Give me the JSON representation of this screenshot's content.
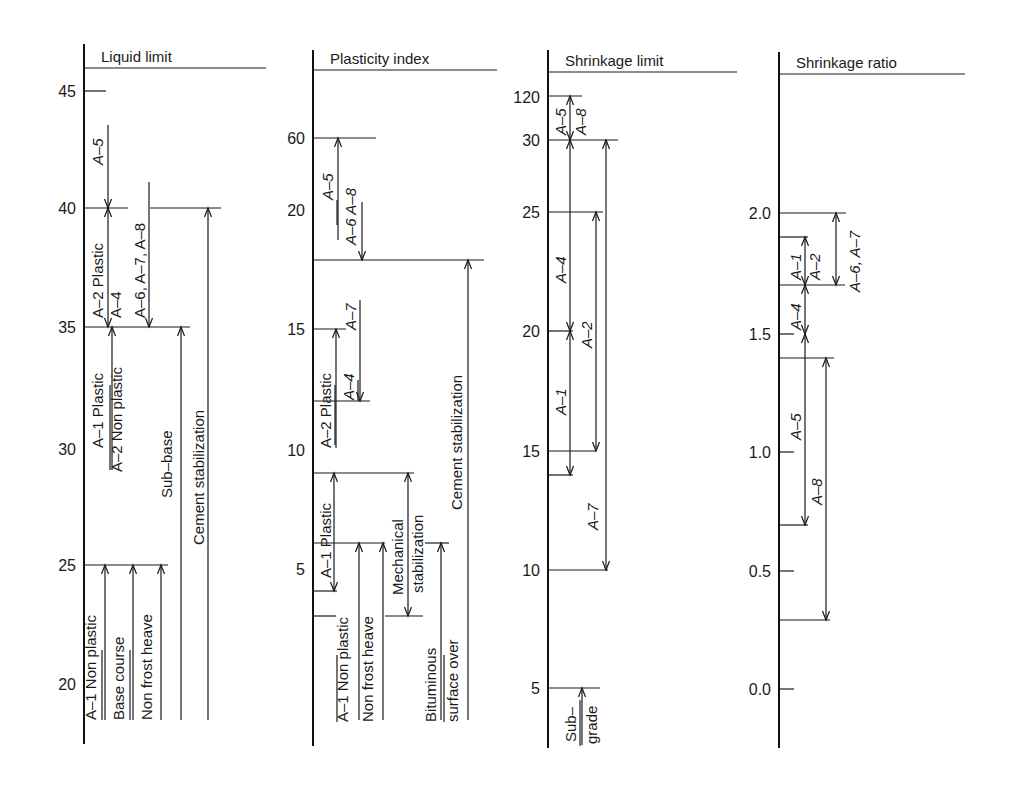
{
  "chart_data": {
    "type": "table",
    "panels": [
      {
        "id": "liquid-limit",
        "title": "Liquid limit",
        "axis_x": 84,
        "title_line": {
          "y": 68,
          "x2": 266
        },
        "ticks": [
          {
            "label": "45",
            "y": 91,
            "len": 22
          },
          {
            "label": "40",
            "y": 208,
            "len": 0
          },
          {
            "label": "35",
            "y": 327,
            "len": 0
          },
          {
            "label": "30",
            "y": 449,
            "len": 0
          },
          {
            "label": "25",
            "y": 565,
            "len": 0
          },
          {
            "label": "20",
            "y": 684,
            "len": 0
          }
        ],
        "hlines": [
          {
            "y": 208,
            "x1": 84,
            "x2": 128
          },
          {
            "y": 208,
            "x1": 150,
            "x2": 221
          },
          {
            "y": 327,
            "x1": 84,
            "x2": 190
          },
          {
            "y": 565,
            "x1": 84,
            "x2": 168
          }
        ],
        "arrows": [
          {
            "x": 108,
            "y1": 125,
            "y2": 208,
            "head": "end"
          },
          {
            "x": 108,
            "y1": 208,
            "y2": 327,
            "head": "both"
          },
          {
            "x": 149,
            "y1": 182,
            "y2": 327,
            "head": "end"
          },
          {
            "x": 112,
            "y1": 327,
            "y2": 470,
            "head": "start"
          },
          {
            "x": 181,
            "y1": 327,
            "y2": 720,
            "head": "start"
          },
          {
            "x": 208,
            "y1": 208,
            "y2": 720,
            "head": "start"
          },
          {
            "x": 105,
            "y1": 565,
            "y2": 720,
            "head": "start"
          },
          {
            "x": 133,
            "y1": 565,
            "y2": 720,
            "head": "start"
          },
          {
            "x": 161,
            "y1": 565,
            "y2": 720,
            "head": "start"
          }
        ],
        "labels": [
          {
            "text": "A-5",
            "x": 103,
            "y": 165,
            "italic": true
          },
          {
            "text": "A-2 Plastic",
            "x": 103,
            "y": 318,
            "italic": false
          },
          {
            "text": "A-4",
            "x": 121,
            "y": 318,
            "italic": false
          },
          {
            "text": "A-6, A-7, A-8",
            "x": 145,
            "y": 318,
            "italic": false
          },
          {
            "text": "A-1 Plastic",
            "x": 103,
            "y": 448,
            "italic": false
          },
          {
            "text": "A-2 Non plastic",
            "x": 122,
            "y": 472,
            "italic": false
          },
          {
            "text": "Sub-base",
            "x": 172,
            "y": 498,
            "italic": false
          },
          {
            "text": "Cement stabilization",
            "x": 204,
            "y": 545,
            "italic": false
          },
          {
            "text": "A-1 Non plastic",
            "x": 96,
            "y": 720,
            "italic": false
          },
          {
            "text": "Base course",
            "x": 124,
            "y": 720,
            "italic": false
          },
          {
            "text": "Non frost heave",
            "x": 152,
            "y": 720,
            "italic": false
          }
        ],
        "rules": [
          {
            "x": 110,
            "y1": 385,
            "y2": 470
          },
          {
            "x": 102,
            "y1": 650,
            "y2": 720
          },
          {
            "x": 130,
            "y1": 650,
            "y2": 720
          }
        ],
        "axis_y": [
          44,
          744
        ]
      },
      {
        "id": "plasticity-index",
        "title": "Plasticity index",
        "axis_x": 313,
        "title_line": {
          "y": 70,
          "x2": 497
        },
        "ticks": [
          {
            "label": "60",
            "y": 138,
            "len": 0
          },
          {
            "label": "20",
            "y": 210,
            "len": 0
          },
          {
            "label": "15",
            "y": 329,
            "len": 0
          },
          {
            "label": "10",
            "y": 450,
            "len": 0
          },
          {
            "label": "5",
            "y": 569,
            "len": 0
          }
        ],
        "hlines": [
          {
            "y": 138,
            "x1": 313,
            "x2": 376
          },
          {
            "y": 260,
            "x1": 313,
            "x2": 484
          },
          {
            "y": 329,
            "x1": 313,
            "x2": 346
          },
          {
            "y": 401,
            "x1": 313,
            "x2": 370
          },
          {
            "y": 473,
            "x1": 313,
            "x2": 414
          },
          {
            "y": 543,
            "x1": 313,
            "x2": 385
          },
          {
            "y": 543,
            "x1": 425,
            "x2": 449
          },
          {
            "y": 591,
            "x1": 313,
            "x2": 337
          },
          {
            "y": 616,
            "x1": 313,
            "x2": 336
          },
          {
            "y": 616,
            "x1": 385,
            "x2": 423
          }
        ],
        "arrows": [
          {
            "x": 338,
            "y1": 138,
            "y2": 240,
            "head": "start"
          },
          {
            "x": 362,
            "y1": 202,
            "y2": 260,
            "head": "end"
          },
          {
            "x": 336,
            "y1": 329,
            "y2": 448,
            "head": "start"
          },
          {
            "x": 360,
            "y1": 300,
            "y2": 401,
            "head": "end"
          },
          {
            "x": 468,
            "y1": 260,
            "y2": 720,
            "head": "start"
          },
          {
            "x": 334,
            "y1": 473,
            "y2": 591,
            "head": "both"
          },
          {
            "x": 359,
            "y1": 543,
            "y2": 720,
            "head": "start"
          },
          {
            "x": 383,
            "y1": 543,
            "y2": 720,
            "head": "start"
          },
          {
            "x": 408,
            "y1": 473,
            "y2": 616,
            "head": "both"
          },
          {
            "x": 441,
            "y1": 543,
            "y2": 720,
            "head": "start"
          }
        ],
        "labels": [
          {
            "text": "A-5",
            "x": 333,
            "y": 200,
            "italic": true
          },
          {
            "text": "A-6 A-8",
            "x": 356,
            "y": 245,
            "italic": true
          },
          {
            "text": "A-7",
            "x": 356,
            "y": 330,
            "italic": true
          },
          {
            "text": "A-2 Plastic",
            "x": 331,
            "y": 448,
            "italic": false
          },
          {
            "text": "A-4",
            "x": 354,
            "y": 400,
            "italic": true
          },
          {
            "text": "A-1 Plastic",
            "x": 331,
            "y": 578,
            "italic": false
          },
          {
            "text": "Cement stabilization",
            "x": 462,
            "y": 510,
            "italic": false
          },
          {
            "text": "Mechanical",
            "x": 403,
            "y": 595,
            "italic": false
          },
          {
            "text": "stabilization",
            "x": 423,
            "y": 593,
            "italic": false
          },
          {
            "text": "A-1 Non plastic",
            "x": 348,
            "y": 722,
            "italic": false
          },
          {
            "text": "Non frost heave",
            "x": 373,
            "y": 722,
            "italic": false
          },
          {
            "text": "Bituminous",
            "x": 436,
            "y": 722,
            "italic": false
          },
          {
            "text": "surface over",
            "x": 458,
            "y": 722,
            "italic": false
          }
        ],
        "rules": [
          {
            "x": 337,
            "y1": 200,
            "y2": 225
          },
          {
            "x": 335,
            "y1": 385,
            "y2": 445
          },
          {
            "x": 358,
            "y1": 380,
            "y2": 401
          },
          {
            "x": 337,
            "y1": 655,
            "y2": 722
          },
          {
            "x": 444,
            "y1": 655,
            "y2": 722
          }
        ],
        "axis_y": [
          50,
          746
        ]
      },
      {
        "id": "shrinkage-limit",
        "title": "Shrinkage limit",
        "axis_x": 548,
        "title_line": {
          "y": 72,
          "x2": 737
        },
        "ticks": [
          {
            "label": "120",
            "y": 97,
            "len": 0
          },
          {
            "label": "30",
            "y": 140,
            "len": 0
          },
          {
            "label": "25",
            "y": 212,
            "len": 0
          },
          {
            "label": "20",
            "y": 331,
            "len": 0
          },
          {
            "label": "15",
            "y": 451,
            "len": 0
          },
          {
            "label": "10",
            "y": 570,
            "len": 0
          },
          {
            "label": "5",
            "y": 688,
            "len": 0
          }
        ],
        "hlines": [
          {
            "y": 96,
            "x1": 548,
            "x2": 582
          },
          {
            "y": 140,
            "x1": 548,
            "x2": 618
          },
          {
            "y": 212,
            "x1": 548,
            "x2": 603
          },
          {
            "y": 331,
            "x1": 548,
            "x2": 573
          },
          {
            "y": 451,
            "x1": 548,
            "x2": 596
          },
          {
            "y": 475,
            "x1": 548,
            "x2": 573
          },
          {
            "y": 570,
            "x1": 548,
            "x2": 608
          },
          {
            "y": 688,
            "x1": 548,
            "x2": 600
          }
        ],
        "arrows": [
          {
            "x": 570,
            "y1": 96,
            "y2": 140,
            "head": "both"
          },
          {
            "x": 570,
            "y1": 140,
            "y2": 331,
            "head": "both"
          },
          {
            "x": 570,
            "y1": 331,
            "y2": 475,
            "head": "both"
          },
          {
            "x": 596,
            "y1": 212,
            "y2": 451,
            "head": "both"
          },
          {
            "x": 606,
            "y1": 140,
            "y2": 570,
            "head": "both"
          },
          {
            "x": 582,
            "y1": 688,
            "y2": 745,
            "head": "start"
          }
        ],
        "labels": [
          {
            "text": "A-5",
            "x": 566,
            "y": 135,
            "italic": true
          },
          {
            "text": "A-8",
            "x": 586,
            "y": 135,
            "italic": true
          },
          {
            "text": "A-4",
            "x": 566,
            "y": 283,
            "italic": true
          },
          {
            "text": "A-2",
            "x": 592,
            "y": 348,
            "italic": true
          },
          {
            "text": "A-1",
            "x": 566,
            "y": 415,
            "italic": true
          },
          {
            "text": "A-7",
            "x": 598,
            "y": 530,
            "italic": true
          },
          {
            "text": "Sub-",
            "x": 576,
            "y": 742,
            "italic": false
          },
          {
            "text": "grade",
            "x": 597,
            "y": 744,
            "italic": false
          }
        ],
        "rules": [
          {
            "x": 580,
            "y1": 700,
            "y2": 746
          }
        ],
        "axis_y": [
          50,
          748
        ]
      },
      {
        "id": "shrinkage-ratio",
        "title": "Shrinkage ratio",
        "axis_x": 779,
        "title_line": {
          "y": 74,
          "x2": 965
        },
        "ticks": [
          {
            "label": "2.0",
            "y": 213,
            "len": 0
          },
          {
            "label": "1.5",
            "y": 334,
            "len": 15
          },
          {
            "label": "1.0",
            "y": 452,
            "len": 15
          },
          {
            "label": "0.5",
            "y": 571,
            "len": 15
          },
          {
            "label": "0.0",
            "y": 689,
            "len": 15
          }
        ],
        "hlines": [
          {
            "y": 213,
            "x1": 779,
            "x2": 846
          },
          {
            "y": 237,
            "x1": 779,
            "x2": 808
          },
          {
            "y": 285,
            "x1": 779,
            "x2": 845
          },
          {
            "y": 358,
            "x1": 779,
            "x2": 834
          },
          {
            "y": 525,
            "x1": 779,
            "x2": 808
          },
          {
            "y": 620,
            "x1": 779,
            "x2": 830
          }
        ],
        "arrows": [
          {
            "x": 805,
            "y1": 237,
            "y2": 285,
            "head": "both"
          },
          {
            "x": 805,
            "y1": 285,
            "y2": 334,
            "head": "both"
          },
          {
            "x": 805,
            "y1": 334,
            "y2": 525,
            "head": "both"
          },
          {
            "x": 836,
            "y1": 213,
            "y2": 285,
            "head": "both"
          },
          {
            "x": 826,
            "y1": 358,
            "y2": 620,
            "head": "both"
          }
        ],
        "labels": [
          {
            "text": "A-1",
            "x": 801,
            "y": 280,
            "italic": true
          },
          {
            "text": "A-2",
            "x": 820,
            "y": 280,
            "italic": true
          },
          {
            "text": "A-6, A-7",
            "x": 860,
            "y": 292,
            "italic": true
          },
          {
            "text": "A-4",
            "x": 801,
            "y": 330,
            "italic": true
          },
          {
            "text": "A-5",
            "x": 801,
            "y": 440,
            "italic": true
          },
          {
            "text": "A-8",
            "x": 822,
            "y": 505,
            "italic": true
          }
        ],
        "rules": [],
        "axis_y": [
          52,
          748
        ]
      }
    ]
  }
}
